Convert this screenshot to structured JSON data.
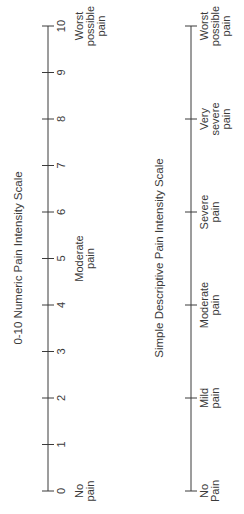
{
  "orientation": "rotated-90-ccw",
  "numeric_scale": {
    "title": "0-10 Numeric Pain Intensity Scale",
    "ticks": [
      "0",
      "1",
      "2",
      "3",
      "4",
      "5",
      "6",
      "7",
      "8",
      "9",
      "10"
    ],
    "anchors": [
      {
        "at": 0,
        "lines": [
          "No",
          "pain"
        ]
      },
      {
        "at": 5,
        "lines": [
          "Moderate",
          "pain"
        ]
      },
      {
        "at": 10,
        "lines": [
          "Worst",
          "possible",
          "pain"
        ]
      }
    ]
  },
  "descriptive_scale": {
    "title": "Simple Descriptive Pain Intensity Scale",
    "points": [
      {
        "at": 0,
        "lines": [
          "No",
          "Pain"
        ]
      },
      {
        "at": 2,
        "lines": [
          "Mild",
          "pain"
        ]
      },
      {
        "at": 4,
        "lines": [
          "Moderate",
          "pain"
        ]
      },
      {
        "at": 6,
        "lines": [
          "Severe",
          "pain"
        ]
      },
      {
        "at": 8,
        "lines": [
          "Very",
          "severe",
          "pain"
        ]
      },
      {
        "at": 10,
        "lines": [
          "Worst",
          "possible",
          "pain"
        ]
      }
    ]
  },
  "colors": {
    "ink": "#3a3a3a",
    "background": "#ffffff"
  }
}
